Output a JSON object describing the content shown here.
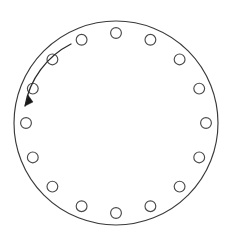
{
  "figure": {
    "background_color": "#ffffff",
    "width": 231,
    "height": 240
  },
  "outer_circle": {
    "name": "outer-boundary-circle",
    "center_x": 116,
    "center_y": 123,
    "radius": 102,
    "stroke_color": "#3a3a3a",
    "stroke_width": 1.15,
    "fill": "none"
  },
  "bolt_ring": {
    "count": 16,
    "hole_radius": 5.4,
    "ring_radius": 90,
    "center_x": 116,
    "center_y": 123,
    "start_angle_deg": -90,
    "step_angle_deg": 22.5,
    "stroke_color": "#4a4a4a",
    "fill_color": "#ffffff",
    "holes": [
      {
        "index": 1,
        "angle_deg": -90.0,
        "cx": 116.0,
        "cy": 33.0
      },
      {
        "index": 2,
        "angle_deg": -67.5,
        "cx": 150.4,
        "cy": 39.8
      },
      {
        "index": 3,
        "angle_deg": -45.0,
        "cx": 179.6,
        "cy": 59.4
      },
      {
        "index": 4,
        "angle_deg": -22.5,
        "cx": 199.2,
        "cy": 88.6
      },
      {
        "index": 5,
        "angle_deg": 0.0,
        "cx": 206.0,
        "cy": 123.0
      },
      {
        "index": 6,
        "angle_deg": 22.5,
        "cx": 199.2,
        "cy": 157.4
      },
      {
        "index": 7,
        "angle_deg": 45.0,
        "cx": 179.6,
        "cy": 186.6
      },
      {
        "index": 8,
        "angle_deg": 67.5,
        "cx": 150.4,
        "cy": 206.2
      },
      {
        "index": 9,
        "angle_deg": 90.0,
        "cx": 116.0,
        "cy": 213.0
      },
      {
        "index": 10,
        "angle_deg": 112.5,
        "cx": 81.6,
        "cy": 206.2
      },
      {
        "index": 11,
        "angle_deg": 135.0,
        "cx": 52.4,
        "cy": 186.6
      },
      {
        "index": 12,
        "angle_deg": 157.5,
        "cx": 32.8,
        "cy": 157.4
      },
      {
        "index": 13,
        "angle_deg": 180.0,
        "cx": 26.0,
        "cy": 123.0
      },
      {
        "index": 14,
        "angle_deg": 202.5,
        "cx": 32.8,
        "cy": 88.6
      },
      {
        "index": 15,
        "angle_deg": 225.0,
        "cx": 52.4,
        "cy": 59.4
      },
      {
        "index": 16,
        "angle_deg": 247.5,
        "cx": 81.6,
        "cy": 39.8
      }
    ]
  },
  "direction_arrow": {
    "name": "counterclockwise-rotation-arrow",
    "direction": "counterclockwise",
    "arc_path": "M 71 44 A 86 86 0 0 0 25 106",
    "arrow_head_points": "25,106 33,102 28,95",
    "stroke_color": "#2b2b2b",
    "stroke_width": 1.3,
    "head_fill": "#1a1a1a"
  }
}
